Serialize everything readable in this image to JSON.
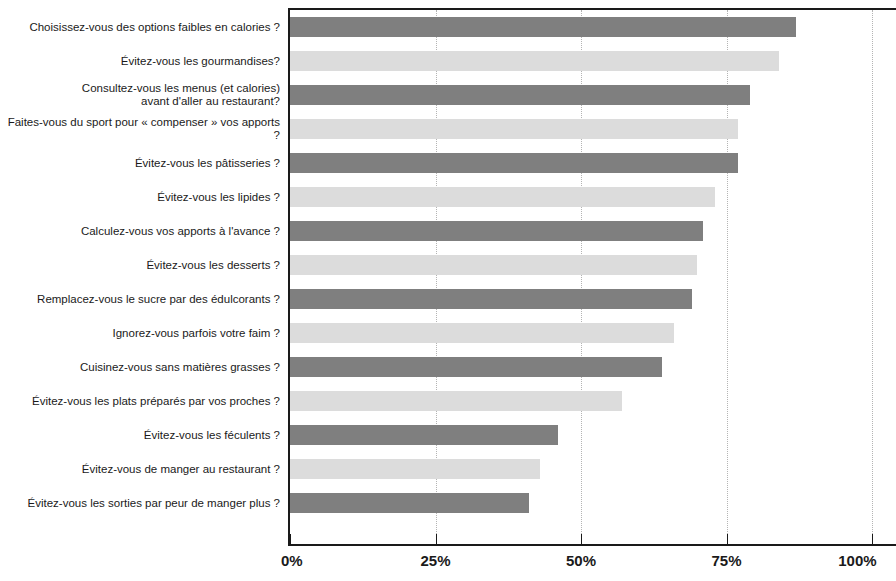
{
  "chart_data": {
    "type": "bar",
    "orientation": "horizontal",
    "title": "",
    "xlabel": "",
    "ylabel": "",
    "xlim": [
      0,
      100
    ],
    "grid": true,
    "legend": "none",
    "tick_labels": [
      "0%",
      "25%",
      "50%",
      "75%",
      "100%"
    ],
    "tick_values": [
      0,
      25,
      50,
      75,
      100
    ],
    "bar_colors": {
      "dark": "#7f7f7f",
      "light": "#dcdcdc"
    },
    "categories": [
      "Choisissez-vous des options faibles en calories ?",
      "Évitez-vous les gourmandises?",
      "Consultez-vous les menus (et calories)\navant d'aller au restaurant?",
      "Faites-vous du sport pour « compenser » vos apports ?",
      "Évitez-vous les pâtisseries ?",
      "Évitez-vous les lipides ?",
      "Calculez-vous vos apports à l'avance ?",
      "Évitez-vous les desserts ?",
      "Remplacez-vous le sucre par des édulcorants ?",
      "Ignorez-vous parfois votre faim ?",
      "Cuisinez-vous sans matières grasses ?",
      "Évitez-vous les plats préparés par vos proches ?",
      "Évitez-vous les féculents ?",
      "Évitez-vous de manger au restaurant ?",
      "Évitez-vous les sorties par peur de manger plus ?"
    ],
    "values": [
      87,
      84,
      79,
      77,
      77,
      73,
      71,
      70,
      69,
      66,
      64,
      57,
      46,
      43,
      41
    ]
  }
}
